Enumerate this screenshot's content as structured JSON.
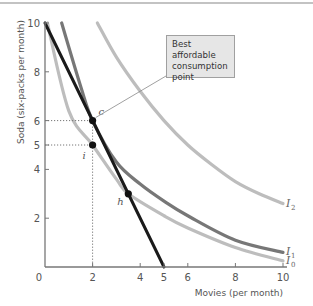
{
  "chart_data": {
    "type": "line",
    "title": "",
    "xlabel": "Movies (per month)",
    "ylabel": "Soda (six-packs per month)",
    "xlim": [
      0,
      10
    ],
    "ylim": [
      0,
      10
    ],
    "x_ticks": [
      0,
      2,
      4,
      5,
      6,
      8,
      10
    ],
    "y_ticks": [
      2,
      4,
      5,
      6,
      8,
      10
    ],
    "grid": false,
    "series": [
      {
        "name": "Budget line",
        "type": "line",
        "color": "#1a1a1a",
        "points": [
          [
            0,
            10
          ],
          [
            5,
            0
          ]
        ]
      },
      {
        "name": "I0",
        "type": "indifference_curve",
        "color": "#bdbdbd",
        "points": [
          [
            0.1,
            10
          ],
          [
            1,
            6.4
          ],
          [
            2,
            5
          ],
          [
            3,
            3.6
          ],
          [
            3.5,
            3
          ],
          [
            5,
            2.1
          ],
          [
            6,
            1.6
          ],
          [
            8,
            0.8
          ],
          [
            10,
            0.25
          ]
        ]
      },
      {
        "name": "I1",
        "type": "indifference_curve",
        "color": "#777777",
        "points": [
          [
            0.7,
            10
          ],
          [
            1.5,
            7.4
          ],
          [
            2,
            6
          ],
          [
            3,
            4.3
          ],
          [
            4,
            3.4
          ],
          [
            5,
            2.7
          ],
          [
            6,
            2.1
          ],
          [
            8,
            1.1
          ],
          [
            10,
            0.6
          ]
        ]
      },
      {
        "name": "I2",
        "type": "indifference_curve",
        "color": "#bdbdbd",
        "points": [
          [
            2.2,
            10
          ],
          [
            3,
            8.6
          ],
          [
            4,
            7.2
          ],
          [
            5,
            6
          ],
          [
            6,
            5
          ],
          [
            7,
            4.2
          ],
          [
            8,
            3.5
          ],
          [
            9,
            3
          ],
          [
            10,
            2.6
          ]
        ]
      }
    ],
    "points": [
      {
        "label": "c",
        "x": 2,
        "y": 6
      },
      {
        "label": "i",
        "x": 2,
        "y": 5
      },
      {
        "label": "h",
        "x": 3.5,
        "y": 3
      }
    ],
    "annotations": [
      {
        "text": "Best affordable consumption point",
        "target": "c"
      }
    ],
    "curve_labels": [
      {
        "base": "I",
        "sub": "2",
        "curve": "I2"
      },
      {
        "base": "I",
        "sub": "1",
        "curve": "I1"
      },
      {
        "base": "I",
        "sub": "0",
        "curve": "I0"
      }
    ],
    "origin_label": "0"
  },
  "callout": {
    "line1": "Best affordable",
    "line2": "consumption",
    "line3": "point"
  }
}
